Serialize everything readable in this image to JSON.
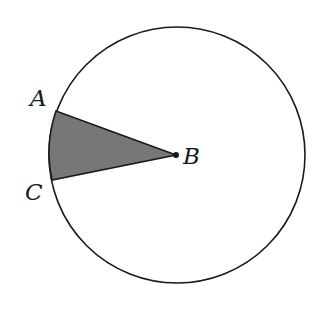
{
  "diagram": {
    "type": "circle-sector",
    "circle": {
      "cx": 177,
      "cy": 155,
      "r": 128
    },
    "center_point": {
      "label": "B",
      "x": 176,
      "y": 155
    },
    "points": [
      {
        "label": "A",
        "x": 56,
        "y": 111
      },
      {
        "label": "C",
        "x": 52,
        "y": 180
      }
    ],
    "sector_fill": "#777777",
    "stroke": "#1a1a1a",
    "labels": {
      "a": "A",
      "b": "B",
      "c": "C"
    }
  }
}
